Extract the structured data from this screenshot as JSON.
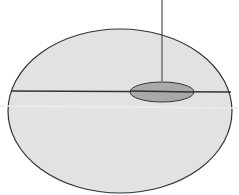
{
  "diagram": {
    "colors": {
      "background": "#ffffff",
      "outer_fill": "#e2e2e2",
      "outer_stroke": "#333333",
      "inner_fill": "#a9a9a9",
      "inner_stroke": "#333333",
      "line": "#333333",
      "faint_line": "#ececec"
    },
    "shapes": {
      "outer_ellipse": {
        "cx": 120,
        "cy": 111,
        "rx": 112,
        "ry": 82
      },
      "inner_ellipse": {
        "cx": 162,
        "cy": 92,
        "rx": 32,
        "ry": 10
      },
      "horizontal_line": {
        "x1": 11,
        "y1": 91,
        "x2": 231,
        "y2": 92
      },
      "faint_line": {
        "x1": 0,
        "y1": 106,
        "x2": 239,
        "y2": 108
      },
      "vertical_line": {
        "x1": 162,
        "y1": 0,
        "x2": 162,
        "y2": 81
      }
    }
  }
}
